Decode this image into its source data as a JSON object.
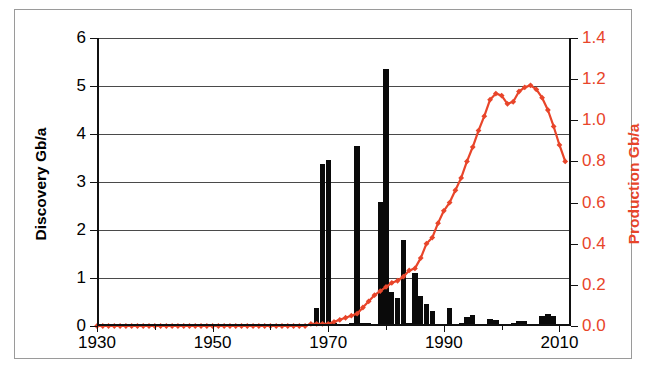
{
  "chart_data": {
    "type": "bar",
    "title": "",
    "subtitle": "",
    "xlabel": "",
    "ylabel": "Discovery Gb/a",
    "y2label": "Production Gb/a",
    "grid": true,
    "legend": "none",
    "xlim": [
      1930,
      2012
    ],
    "ylim": [
      0,
      6
    ],
    "y2lim": [
      0,
      1.4
    ],
    "xticks": [
      1930,
      1950,
      1970,
      1990,
      2010
    ],
    "xtick_labels": [
      "1930",
      "1950",
      "1970",
      "1990",
      "2010"
    ],
    "xtick_minor": [
      1940,
      1960,
      1980,
      2000
    ],
    "yticks": [
      0,
      1,
      2,
      3,
      4,
      5,
      6
    ],
    "ytick_labels": [
      "0",
      "1",
      "2",
      "3",
      "4",
      "5",
      "6"
    ],
    "y2ticks": [
      0.0,
      0.2,
      0.4,
      0.6,
      0.8,
      1.0,
      1.2,
      1.4
    ],
    "y2tick_labels": [
      "0.0",
      "0.2",
      "0.4",
      "0.6",
      "0.8",
      "1.0",
      "1.2",
      "1.4"
    ],
    "bar_color": "#0a0a0a",
    "line_color": "#e8452a",
    "series": [
      {
        "name": "Discovery Gb/a",
        "type": "bar",
        "axis": "left",
        "x": [
          1930,
          1931,
          1932,
          1933,
          1934,
          1935,
          1936,
          1937,
          1938,
          1939,
          1940,
          1941,
          1942,
          1943,
          1944,
          1945,
          1946,
          1947,
          1948,
          1949,
          1950,
          1951,
          1952,
          1953,
          1954,
          1955,
          1956,
          1957,
          1958,
          1959,
          1960,
          1961,
          1962,
          1963,
          1964,
          1965,
          1966,
          1967,
          1968,
          1969,
          1970,
          1971,
          1972,
          1973,
          1974,
          1975,
          1976,
          1977,
          1978,
          1979,
          1980,
          1981,
          1982,
          1983,
          1984,
          1985,
          1986,
          1987,
          1988,
          1989,
          1990,
          1991,
          1992,
          1993,
          1994,
          1995,
          1996,
          1997,
          1998,
          1999,
          2000,
          2001,
          2002,
          2003,
          2004,
          2005,
          2006,
          2007,
          2008,
          2009,
          2010,
          2011
        ],
        "values": [
          0,
          0,
          0,
          0,
          0,
          0,
          0,
          0,
          0,
          0,
          0,
          0,
          0,
          0,
          0,
          0,
          0,
          0,
          0,
          0,
          0,
          0,
          0,
          0,
          0,
          0,
          0,
          0,
          0,
          0,
          0,
          0,
          0,
          0,
          0,
          0,
          0,
          0,
          0.38,
          3.38,
          3.45,
          0.06,
          0.05,
          0.05,
          0.06,
          3.75,
          0.06,
          0.06,
          0.05,
          2.58,
          5.35,
          0.7,
          0.58,
          1.8,
          0.06,
          1.1,
          0.62,
          0.45,
          0.32,
          0.05,
          0.05,
          0.38,
          0.05,
          0.06,
          0.18,
          0.22,
          0.05,
          0.05,
          0.15,
          0.13,
          0.03,
          0.03,
          0.06,
          0.11,
          0.1,
          0.04,
          0.04,
          0.2,
          0.25,
          0.2,
          0.05,
          0.02
        ]
      },
      {
        "name": "Production Gb/a",
        "type": "line",
        "axis": "right",
        "marker": "diamond",
        "x": [
          1930,
          1931,
          1932,
          1933,
          1934,
          1935,
          1936,
          1937,
          1938,
          1939,
          1940,
          1941,
          1942,
          1943,
          1944,
          1945,
          1946,
          1947,
          1948,
          1949,
          1950,
          1951,
          1952,
          1953,
          1954,
          1955,
          1956,
          1957,
          1958,
          1959,
          1960,
          1961,
          1962,
          1963,
          1964,
          1965,
          1966,
          1967,
          1968,
          1969,
          1970,
          1971,
          1972,
          1973,
          1974,
          1975,
          1976,
          1977,
          1978,
          1979,
          1980,
          1981,
          1982,
          1983,
          1984,
          1985,
          1986,
          1987,
          1988,
          1989,
          1990,
          1991,
          1992,
          1993,
          1994,
          1995,
          1996,
          1997,
          1998,
          1999,
          2000,
          2001,
          2002,
          2003,
          2004,
          2005,
          2006,
          2007,
          2008,
          2009,
          2010,
          2011
        ],
        "values": [
          0.0,
          0.0,
          0.0,
          0.0,
          0.0,
          0.0,
          0.0,
          0.0,
          0.0,
          0.0,
          0.0,
          0.0,
          0.0,
          0.0,
          0.0,
          0.0,
          0.0,
          0.0,
          0.0,
          0.0,
          0.0,
          0.0,
          0.0,
          0.0,
          0.0,
          0.0,
          0.0,
          0.0,
          0.0,
          0.0,
          0.0,
          0.0,
          0.0,
          0.0,
          0.0,
          0.0,
          0.0,
          0.01,
          0.01,
          0.01,
          0.01,
          0.02,
          0.03,
          0.04,
          0.05,
          0.06,
          0.09,
          0.12,
          0.15,
          0.17,
          0.19,
          0.21,
          0.22,
          0.24,
          0.27,
          0.28,
          0.33,
          0.4,
          0.43,
          0.5,
          0.56,
          0.6,
          0.66,
          0.72,
          0.8,
          0.87,
          0.95,
          1.02,
          1.1,
          1.13,
          1.12,
          1.08,
          1.09,
          1.14,
          1.16,
          1.17,
          1.15,
          1.11,
          1.05,
          0.97,
          0.88,
          0.8
        ]
      }
    ]
  },
  "axes": {
    "left_title": "Discovery Gb/a",
    "right_title": "Production Gb/a"
  }
}
